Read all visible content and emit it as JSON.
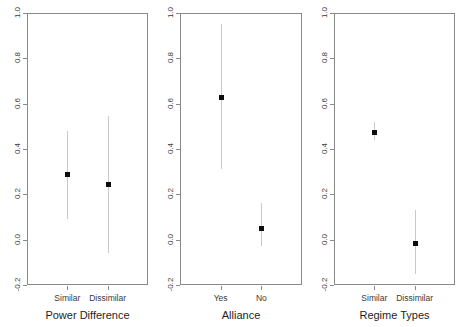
{
  "chart_data": {
    "type": "scatter",
    "title": "",
    "subtitle": "",
    "ylabel": "",
    "ylim": [
      -0.2,
      1.0
    ],
    "yticks": [
      "-0.2",
      "0.0",
      "0.2",
      "0.4",
      "0.6",
      "0.8",
      "1.0"
    ],
    "ytick_values": [
      -0.2,
      0.0,
      0.2,
      0.4,
      0.6,
      0.8,
      1.0
    ],
    "grid": false,
    "legend": "none",
    "error_bars": "vertical 95% confidence intervals",
    "marker": "filled square",
    "panels": [
      {
        "xlabel": "Power Difference",
        "categories": [
          "Similar",
          "Dissimilar"
        ],
        "values": [
          0.29,
          0.245
        ],
        "ci_low": [
          0.09,
          -0.06
        ],
        "ci_high": [
          0.48,
          0.545
        ]
      },
      {
        "xlabel": "Alliance",
        "categories": [
          "Yes",
          "No"
        ],
        "values": [
          0.63,
          0.05
        ],
        "ci_low": [
          0.31,
          -0.03
        ],
        "ci_high": [
          0.95,
          0.16
        ]
      },
      {
        "xlabel": "Regime Types",
        "categories": [
          "Similar",
          "Dissimilar"
        ],
        "values": [
          0.475,
          -0.015
        ],
        "ci_low": [
          0.44,
          -0.15
        ],
        "ci_high": [
          0.52,
          0.13
        ]
      }
    ]
  },
  "colors": {
    "point": "#0d0d0d",
    "errorbar": "#c9c9c9",
    "axis": "#8a8a8a",
    "text": "#2b2b2b",
    "background": "#ffffff"
  }
}
